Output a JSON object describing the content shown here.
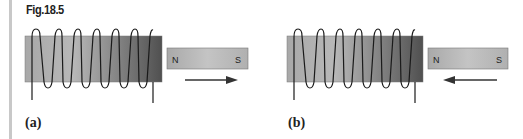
{
  "figure": {
    "title": "Fig.18.5",
    "panels": [
      {
        "label": "(a)",
        "magnet": {
          "north": "N",
          "south": "S"
        },
        "arrow_direction": "right",
        "description": "Bar magnet moving away from the coil"
      },
      {
        "label": "(b)",
        "magnet": {
          "north": "N",
          "south": "S"
        },
        "arrow_direction": "left",
        "description": "Bar magnet moving toward the coil"
      }
    ],
    "colors": {
      "core_light": "#b5b5b5",
      "core_dark": "#5a5a5a",
      "magnet_fill": "#bdbdbd",
      "wire": "#1a1a1a",
      "rule": "#c8c8c8"
    }
  }
}
